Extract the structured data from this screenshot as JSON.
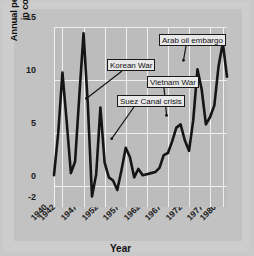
{
  "chart_data": {
    "type": "line",
    "title": "",
    "xlabel": "Year",
    "ylabel": "Annual percentage rate of change in consumer price index",
    "ylabel_line1": "Annual percentage rate of change",
    "ylabel_line2": "in consumer price index",
    "xlim": [
      1940,
      1981
    ],
    "ylim": [
      -2,
      15
    ],
    "ytick_labels": [
      "15",
      "10",
      "5",
      "0",
      "-2"
    ],
    "ytick_values": [
      15,
      10,
      5,
      0,
      -2
    ],
    "xtick_labels": [
      "1940",
      "1942",
      "1947",
      "1952",
      "1957",
      "1962",
      "1967",
      "1972",
      "1977",
      "1980"
    ],
    "xtick_values": [
      1940,
      1942,
      1947,
      1952,
      1957,
      1962,
      1967,
      1972,
      1977,
      1980
    ],
    "grid": "both-white",
    "legend": "none",
    "line_color": "#151515",
    "plot_background": "#bcbcbc",
    "grid_color": "#efefef",
    "x": [
      1940,
      1941,
      1942,
      1943,
      1944,
      1945,
      1946,
      1947,
      1948,
      1949,
      1950,
      1951,
      1952,
      1953,
      1954,
      1955,
      1956,
      1957,
      1958,
      1959,
      1960,
      1961,
      1962,
      1963,
      1964,
      1965,
      1966,
      1967,
      1968,
      1969,
      1970,
      1971,
      1972,
      1973,
      1974,
      1975,
      1976,
      1977,
      1978,
      1979,
      1980,
      1981
    ],
    "values": [
      1.0,
      5.0,
      10.7,
      6.1,
      1.2,
      2.3,
      8.5,
      14.4,
      7.8,
      -1.0,
      1.1,
      7.4,
      2.2,
      0.8,
      0.5,
      -0.4,
      1.5,
      3.6,
      2.7,
      0.8,
      1.6,
      1.0,
      1.1,
      1.2,
      1.3,
      1.7,
      2.9,
      3.1,
      4.2,
      5.5,
      5.8,
      4.3,
      3.3,
      6.2,
      11.0,
      9.1,
      5.8,
      6.5,
      7.6,
      11.3,
      13.5,
      10.3
    ],
    "annotations": [
      {
        "label": "Korean War",
        "target_year": 1951,
        "target_value": 7.4
      },
      {
        "label": "Suez Canal crisis",
        "target_year": 1957,
        "target_value": 3.6
      },
      {
        "label": "Vietnam War",
        "target_year": 1970,
        "target_value": 5.8
      },
      {
        "label": "Arab oil embargo",
        "target_year": 1974,
        "target_value": 11.0
      }
    ]
  }
}
